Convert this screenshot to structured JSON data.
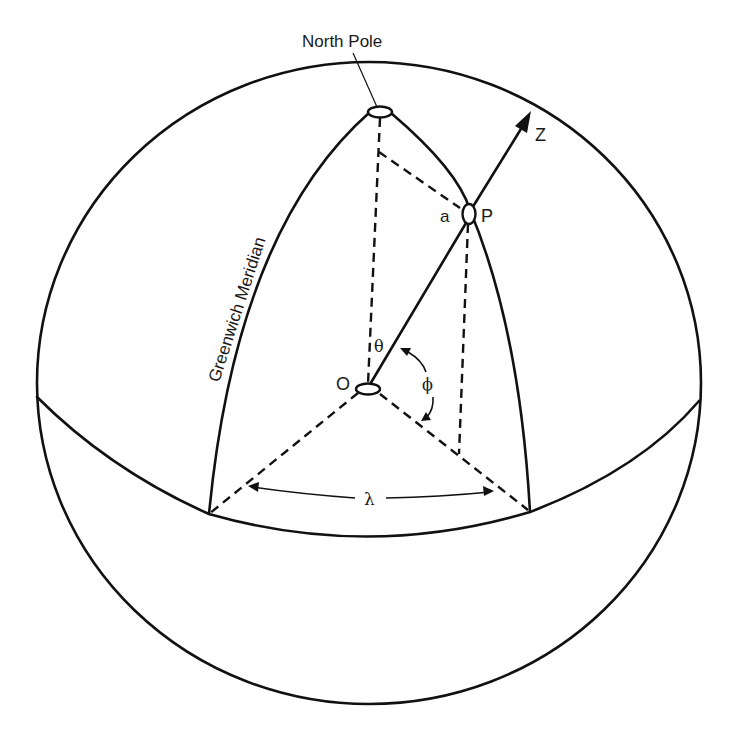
{
  "figure": {
    "type": "spherical coordinate diagram on Earth sphere",
    "labels": {
      "north_pole": "North Pole",
      "greenwich_meridian": "Greenwich Meridian",
      "z_axis": "Z",
      "point_p": "P",
      "point_a": "a",
      "origin": "O",
      "theta": "θ",
      "phi": "ϕ",
      "lambda": "λ"
    },
    "colors": {
      "stroke": "#111111",
      "background": "#ffffff"
    }
  }
}
